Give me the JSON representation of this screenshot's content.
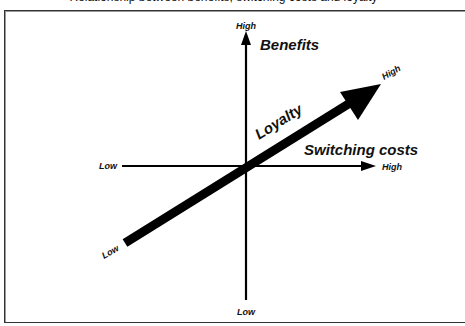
{
  "diagram": {
    "caption_clipped": "Relationship between benefits, switching costs and loyalty",
    "vertical_axis": {
      "label": "Benefits",
      "high": "High",
      "low": "Low"
    },
    "horizontal_axis": {
      "label": "Switching costs",
      "high": "High",
      "low": "Low"
    },
    "diagonal_arrow": {
      "label": "Loyalty",
      "high": "High",
      "low": "Low"
    },
    "colors": {
      "ink": "#000000",
      "frame": "#333333",
      "background": "#ffffff"
    }
  }
}
